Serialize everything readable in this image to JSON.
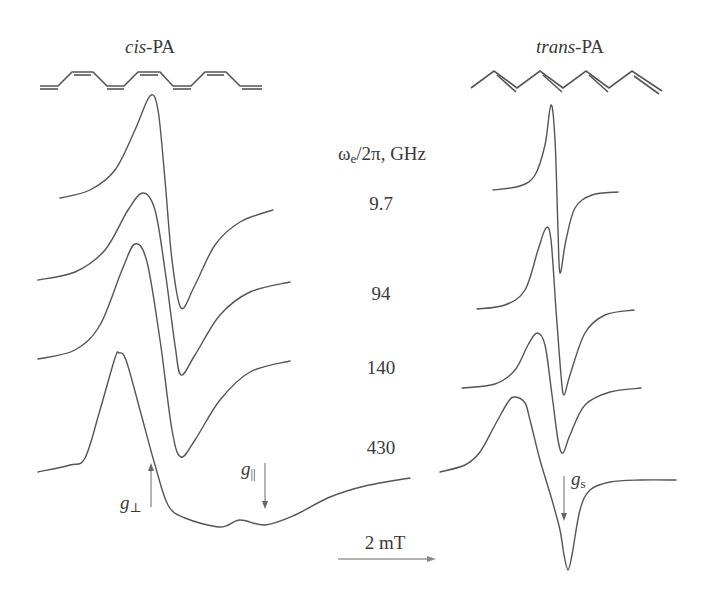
{
  "chart_data": {
    "type": "line",
    "title": "",
    "xlabel": "Magnetic field (scale bar 2 mT)",
    "ylabel": "",
    "grid": false,
    "panels": [
      {
        "name": "cis-PA",
        "series": [
          {
            "name": "9.7 GHz",
            "points": [
              [
                60,
                198
              ],
              [
                90,
                190
              ],
              [
                115,
                170
              ],
              [
                135,
                130
              ],
              [
                150,
                96
              ],
              [
                158,
                110
              ],
              [
                165,
                180
              ],
              [
                172,
                260
              ],
              [
                181,
                308
              ],
              [
                195,
                285
              ],
              [
                215,
                245
              ],
              [
                240,
                222
              ],
              [
                273,
                210
              ]
            ]
          },
          {
            "name": "94 GHz",
            "points": [
              [
                38,
                280
              ],
              [
                75,
                272
              ],
              [
                105,
                250
              ],
              [
                128,
                210
              ],
              [
                143,
                193
              ],
              [
                155,
                210
              ],
              [
                165,
                270
              ],
              [
                175,
                345
              ],
              [
                181,
                375
              ],
              [
                195,
                355
              ],
              [
                220,
                315
              ],
              [
                250,
                292
              ],
              [
                290,
                282
              ]
            ]
          },
          {
            "name": "140 GHz",
            "points": [
              [
                38,
                359
              ],
              [
                75,
                350
              ],
              [
                100,
                325
              ],
              [
                122,
                270
              ],
              [
                135,
                244
              ],
              [
                147,
                262
              ],
              [
                160,
                340
              ],
              [
                172,
                430
              ],
              [
                181,
                457
              ],
              [
                195,
                440
              ],
              [
                220,
                400
              ],
              [
                250,
                372
              ],
              [
                290,
                361
              ]
            ]
          },
          {
            "name": "430 GHz",
            "points": [
              [
                38,
                472
              ],
              [
                70,
                465
              ],
              [
                85,
                458
              ],
              [
                100,
                410
              ],
              [
                115,
                358
              ],
              [
                119,
                353
              ],
              [
                126,
                360
              ],
              [
                140,
                410
              ],
              [
                155,
                465
              ],
              [
                168,
                505
              ],
              [
                185,
                518
              ],
              [
                220,
                527
              ],
              [
                240,
                520
              ],
              [
                265,
                525
              ],
              [
                295,
                515
              ],
              [
                330,
                497
              ],
              [
                365,
                486
              ],
              [
                410,
                478
              ]
            ]
          }
        ]
      },
      {
        "name": "trans-PA",
        "series": [
          {
            "name": "9.7 GHz",
            "points": [
              [
                493,
                190
              ],
              [
                520,
                186
              ],
              [
                535,
                175
              ],
              [
                545,
                145
              ],
              [
                551,
                105
              ],
              [
                555,
                140
              ],
              [
                558,
                230
              ],
              [
                560,
                273
              ],
              [
                566,
                240
              ],
              [
                575,
                208
              ],
              [
                592,
                195
              ],
              [
                618,
                192
              ]
            ]
          },
          {
            "name": "94 GHz",
            "points": [
              [
                477,
                309
              ],
              [
                505,
                305
              ],
              [
                525,
                290
              ],
              [
                538,
                250
              ],
              [
                546,
                228
              ],
              [
                551,
                240
              ],
              [
                556,
                310
              ],
              [
                561,
                375
              ],
              [
                564,
                395
              ],
              [
                570,
                375
              ],
              [
                585,
                333
              ],
              [
                605,
                315
              ],
              [
                634,
                310
              ]
            ]
          },
          {
            "name": "140 GHz",
            "points": [
              [
                462,
                388
              ],
              [
                495,
                384
              ],
              [
                515,
                370
              ],
              [
                528,
                345
              ],
              [
                537,
                333
              ],
              [
                545,
                345
              ],
              [
                552,
                395
              ],
              [
                558,
                440
              ],
              [
                563,
                453
              ],
              [
                570,
                435
              ],
              [
                585,
                405
              ],
              [
                610,
                392
              ],
              [
                641,
                388
              ]
            ]
          },
          {
            "name": "430 GHz",
            "points": [
              [
                440,
                472
              ],
              [
                465,
                465
              ],
              [
                480,
                452
              ],
              [
                495,
                425
              ],
              [
                508,
                402
              ],
              [
                515,
                397
              ],
              [
                525,
                403
              ],
              [
                530,
                420
              ],
              [
                540,
                460
              ],
              [
                552,
                500
              ],
              [
                560,
                530
              ],
              [
                564,
                555
              ],
              [
                568,
                570
              ],
              [
                572,
                555
              ],
              [
                580,
                510
              ],
              [
                590,
                490
              ],
              [
                610,
                482
              ],
              [
                640,
                480
              ],
              [
                676,
                480
              ]
            ]
          }
        ]
      }
    ],
    "annotations": [
      "g⊥",
      "g||",
      "gs",
      "2 mT"
    ],
    "legend": {
      "title": "ωe/2π, GHz",
      "entries": [
        "9.7",
        "94",
        "140",
        "430"
      ]
    }
  },
  "labels": {
    "cis_prefix": "cis",
    "cis_suffix": "-PA",
    "trans_prefix": "trans",
    "trans_suffix": "-PA",
    "freq_omega": "ω",
    "freq_sub": "e",
    "freq_rest": "/2π, GHz",
    "f1": "9.7",
    "f2": "94",
    "f3": "140",
    "f4": "430",
    "g_perp": "g",
    "g_perp_sub": "⊥",
    "g_par": "g",
    "g_par_sub": "||",
    "g_s": "g",
    "g_s_sub": "s",
    "scale": "2 mT"
  }
}
